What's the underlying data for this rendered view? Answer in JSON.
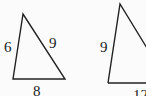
{
  "diagram": {
    "triangles": [
      {
        "name": "left-triangle",
        "sides": {
          "left": "6",
          "right": "9",
          "bottom": "8"
        }
      },
      {
        "name": "right-triangle",
        "sides": {
          "left": "9",
          "bottom": "12"
        }
      }
    ],
    "stroke_color": "#222222"
  }
}
